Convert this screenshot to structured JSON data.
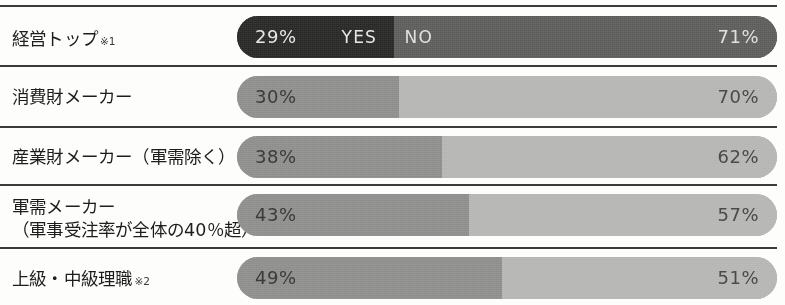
{
  "chart_data": {
    "type": "bar",
    "orientation": "horizontal",
    "stacked": true,
    "title": "",
    "xlabel": "",
    "ylabel": "",
    "xlim": [
      0,
      100
    ],
    "grid": false,
    "legend": {
      "position": "in-first-bar",
      "entries": [
        "YES",
        "NO"
      ]
    },
    "categories": [
      "経営トップ",
      "消費財メーカー",
      "産業財メーカー（軍需除く）",
      "軍需メーカー（軍事受注率が全体の40％超）",
      "上級・中級理職"
    ],
    "series": [
      {
        "name": "YES",
        "values": [
          29,
          30,
          38,
          43,
          49
        ]
      },
      {
        "name": "NO",
        "values": [
          71,
          70,
          62,
          57,
          51
        ]
      }
    ]
  },
  "colors": {
    "page_background": "#fdfdfc",
    "divider": "#3a3a38",
    "label_text": "#1d1d1b",
    "row1_yes_fill": "#262624",
    "row1_no_fill": "#5c5c5a",
    "row1_yes_text": "#e8e6e4",
    "row1_no_text": "#e2e0de",
    "yes_fill": "#8d8d8b",
    "no_fill": "#b5b5b4",
    "yes_text": "#3b3b39",
    "no_text": "#4a4a48"
  },
  "legend": {
    "yes_label": "YES",
    "no_label": "NO"
  },
  "rows": [
    {
      "label_line1": "経営トップ",
      "label_line2": "",
      "note": "※1",
      "yes_pct_label": "29%",
      "no_pct_label": "71%",
      "yes_value": 29,
      "no_value": 71,
      "highlighted": true
    },
    {
      "label_line1": "消費財メーカー",
      "label_line2": "",
      "note": "",
      "yes_pct_label": "30%",
      "no_pct_label": "70%",
      "yes_value": 30,
      "no_value": 70,
      "highlighted": false
    },
    {
      "label_line1": "産業財メーカー（軍需除く）",
      "label_line2": "",
      "note": "",
      "yes_pct_label": "38%",
      "no_pct_label": "62%",
      "yes_value": 38,
      "no_value": 62,
      "highlighted": false
    },
    {
      "label_line1": "軍需メーカー",
      "label_line2": "（軍事受注率が全体の40％超）",
      "note": "",
      "yes_pct_label": "43%",
      "no_pct_label": "57%",
      "yes_value": 43,
      "no_value": 57,
      "highlighted": false
    },
    {
      "label_line1": "上級・中級理職",
      "label_line2": "",
      "note": "※2",
      "yes_pct_label": "49%",
      "no_pct_label": "51%",
      "yes_value": 49,
      "no_value": 51,
      "highlighted": false
    }
  ],
  "layout": {
    "bar_left": 237,
    "bar_width": 540,
    "bar_height": 42,
    "divider_width": 777,
    "row_divider_y": [
      5,
      65,
      126,
      184,
      247
    ],
    "row_bar_y": [
      16,
      76,
      136,
      194,
      257
    ],
    "row_label_y": [
      28,
      86,
      146,
      196,
      268
    ]
  }
}
